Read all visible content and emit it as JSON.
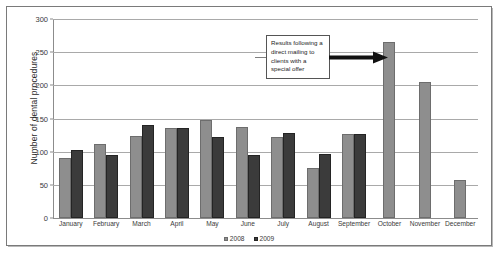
{
  "chart_data": {
    "type": "bar",
    "title": "",
    "xlabel": "",
    "ylabel": "Number of dental procedures",
    "ylim": [
      0,
      300
    ],
    "yticks": [
      0,
      50,
      100,
      150,
      200,
      250,
      300
    ],
    "grid": true,
    "legend_position": "bottom",
    "categories": [
      "January",
      "February",
      "March",
      "April",
      "May",
      "June",
      "July",
      "August",
      "September",
      "October",
      "November",
      "December"
    ],
    "series": [
      {
        "name": "2008",
        "color": "#8e8e8e",
        "values": [
          90,
          112,
          124,
          135,
          148,
          137,
          122,
          75,
          126,
          265,
          205,
          57
        ]
      },
      {
        "name": "2009",
        "color": "#3b3b3b",
        "values": [
          103,
          95,
          140,
          136,
          122,
          95,
          128,
          97,
          126,
          null,
          null,
          null
        ]
      }
    ],
    "annotations": [
      {
        "text": "Results following a direct mailing to clients with a special offer",
        "points_to": "October"
      }
    ]
  },
  "legend": {
    "items": [
      {
        "label": "2008"
      },
      {
        "label": "2009"
      }
    ]
  },
  "axis": {
    "y_title": "Number of dental procedures",
    "y_tick_labels": [
      "300",
      "250",
      "200",
      "150",
      "100",
      "50",
      "0"
    ],
    "x_tick_labels": [
      "January",
      "February",
      "March",
      "April",
      "May",
      "June",
      "July",
      "August",
      "September",
      "October",
      "November",
      "December"
    ]
  },
  "annotation": {
    "text": "Results following a direct mailing to clients with a special offer"
  },
  "icons": {
    "arrow": "right-arrow-icon"
  }
}
